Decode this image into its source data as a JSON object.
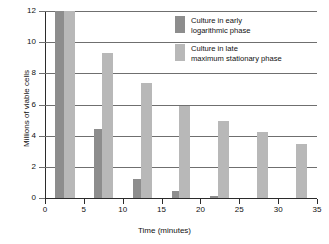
{
  "chart_data": {
    "type": "bar",
    "title": "",
    "xlabel": "Time (minutes)",
    "ylabel": "Millions of viable cells",
    "xlim": [
      0,
      35
    ],
    "ylim": [
      0,
      12
    ],
    "xticks": [
      0,
      5,
      10,
      15,
      20,
      25,
      30,
      35
    ],
    "yticks": [
      0,
      2,
      4,
      6,
      8,
      10,
      12
    ],
    "grid": true,
    "legend_position": "upper-right",
    "series": [
      {
        "name": "Culture in early\nlogarithmic phase",
        "color": "#8d8d8d",
        "x": [
          2,
          7,
          12,
          17,
          22
        ],
        "values": [
          12.0,
          4.4,
          1.25,
          0.45,
          0.1
        ]
      },
      {
        "name": "Culture in late\nmaximum stationary phase",
        "color": "#b8b8b8",
        "x": [
          3.2,
          8,
          13,
          18,
          23,
          28,
          33
        ],
        "values": [
          12.0,
          9.3,
          7.35,
          5.9,
          4.95,
          4.25,
          3.45
        ]
      }
    ]
  },
  "axes": {
    "y_title": "Millions of viable cells",
    "x_title": "Time (minutes)",
    "y_tick_labels": [
      "0",
      "2",
      "4",
      "6",
      "8",
      "10",
      "12"
    ],
    "x_tick_labels": [
      "0",
      "5",
      "10",
      "15",
      "20",
      "25",
      "30",
      "35"
    ]
  },
  "legend": {
    "entries": [
      {
        "label": "Culture in early\nlogarithmic phase",
        "color": "#8d8d8d"
      },
      {
        "label": "Culture in late\nmaximum stationary phase",
        "color": "#b8b8b8"
      }
    ]
  },
  "colors": {
    "dark_bar": "#8d8d8d",
    "light_bar": "#b8b8b8",
    "gridline": "#6f6f6f",
    "axis": "#2b2b2b",
    "text": "#111111",
    "background": "#ffffff"
  }
}
